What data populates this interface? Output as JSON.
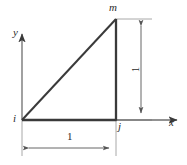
{
  "figure": {
    "type": "geometry-diagram",
    "background_color": "#ffffff",
    "line_color": "#3a3a3a",
    "thin_line_color": "#9a9a9a",
    "text_color": "#2b2b2b"
  },
  "labels": {
    "node_m": "m",
    "node_i": "i",
    "node_j": "j",
    "axis_y": "y",
    "axis_x": "x",
    "dim_bottom": "1",
    "dim_right": "1"
  },
  "geometry": {
    "origin": {
      "x": 22,
      "y": 120
    },
    "node_i": {
      "x": 22,
      "y": 120
    },
    "node_j": {
      "x": 116,
      "y": 120
    },
    "node_m": {
      "x": 116,
      "y": 19
    },
    "x_axis_end": {
      "x": 180,
      "y": 120
    },
    "y_axis_top": {
      "x": 22,
      "y": 31
    },
    "bottom_dim_line_y": 148,
    "right_dim_line_x": 141,
    "base_length": 1,
    "height_length": 1
  }
}
